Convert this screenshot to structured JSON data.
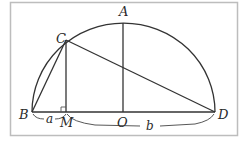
{
  "diagram": {
    "title": "",
    "points": {
      "A": {
        "label": "A",
        "x": 123,
        "y": 23
      },
      "B": {
        "label": "B",
        "x": 32,
        "y": 112
      },
      "C": {
        "label": "C",
        "x": 66,
        "y": 40
      },
      "D": {
        "label": "D",
        "x": 215,
        "y": 112
      },
      "M": {
        "label": "M",
        "x": 66,
        "y": 112
      },
      "O": {
        "label": "O",
        "x": 123,
        "y": 112
      }
    },
    "segment_labels": {
      "a": "a",
      "b": "b"
    },
    "elements": [
      "semicircle with diameter BD and center O",
      "OA perpendicular to BD",
      "CM perpendicular to BD (right angle at M)",
      "chords CB and CD",
      "brace BM labeled a",
      "brace MD labeled b"
    ],
    "colors": {
      "stroke": "#333333",
      "frame": "#bbbbbb",
      "background": "#ffffff"
    }
  }
}
